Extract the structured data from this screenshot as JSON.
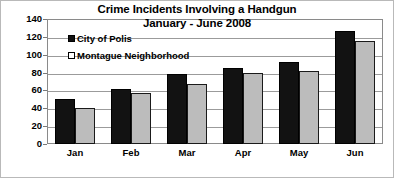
{
  "chart_data": {
    "type": "bar",
    "title": "Crime Incidents Involving a Handgun",
    "subtitle": "January - June 2008",
    "xlabel": "",
    "ylabel": "",
    "categories": [
      "Jan",
      "Feb",
      "Mar",
      "Apr",
      "May",
      "Jun"
    ],
    "series": [
      {
        "name": "City of Polis",
        "color": "#121212",
        "values": [
          50,
          62,
          78,
          85,
          92,
          127
        ]
      },
      {
        "name": "Montague Neighborhood",
        "color": "#bcbcbc",
        "values": [
          40,
          57,
          67,
          80,
          82,
          115
        ]
      }
    ],
    "ylim": [
      0,
      140
    ],
    "ytick_step": 20,
    "yticks": [
      0,
      20,
      40,
      60,
      80,
      100,
      120,
      140
    ],
    "ytick_labels": [
      "0",
      "20",
      "40",
      "60",
      "80",
      "100",
      "120",
      "140"
    ],
    "grid": true,
    "grid_axis": "y",
    "legend_position": "inside-top-left",
    "plot_border_color": "#8a8a8a",
    "gridline_color": "#9b9b9b",
    "background_color": "#ffffff"
  }
}
